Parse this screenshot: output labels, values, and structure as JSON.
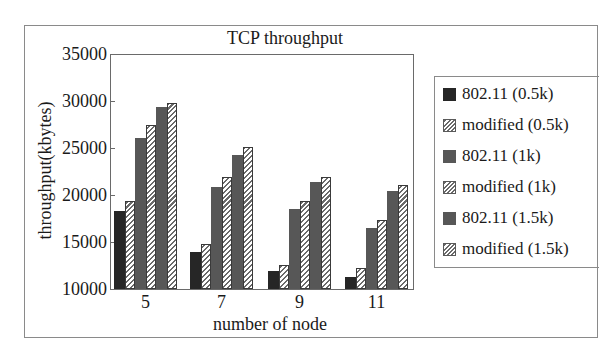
{
  "chart_data": {
    "type": "bar",
    "title": "TCP throughput",
    "xlabel": "number of node",
    "ylabel": "throughput(kbytes)",
    "categories": [
      "5",
      "7",
      "9",
      "11"
    ],
    "ylim": [
      10000,
      35000
    ],
    "yticks": [
      "35000",
      "30000",
      "25000",
      "20000",
      "15000",
      "10000"
    ],
    "grid": false,
    "legend_position": "right",
    "series": [
      {
        "name": "802.11 (0.5k)",
        "style": "solid-dark",
        "values": [
          18300,
          13900,
          11900,
          11300
        ]
      },
      {
        "name": "modified (0.5k)",
        "style": "hatch",
        "values": [
          19400,
          14800,
          12600,
          12200
        ]
      },
      {
        "name": "802.11 (1k)",
        "style": "solid-mid",
        "values": [
          26100,
          20900,
          18500,
          16500
        ]
      },
      {
        "name": "modified (1k)",
        "style": "hatch",
        "values": [
          27500,
          21900,
          19400,
          17300
        ]
      },
      {
        "name": "802.11 (1.5k)",
        "style": "solid-mid",
        "values": [
          29400,
          24300,
          21400,
          20400
        ]
      },
      {
        "name": "modified (1.5k)",
        "style": "hatch",
        "values": [
          29800,
          25100,
          21900,
          21100
        ]
      }
    ]
  },
  "colors": {
    "solid_dark": "#262626",
    "solid_mid": "#575757",
    "hatch_line": "#6a6a6a",
    "frame": "#8a8a8a"
  }
}
